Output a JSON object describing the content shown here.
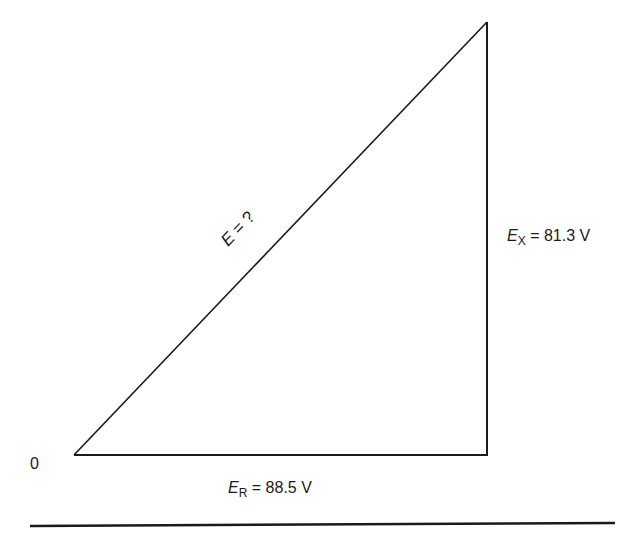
{
  "diagram": {
    "title": "",
    "origin_label": "0",
    "hypotenuse": {
      "symbol": "E",
      "label_suffix": " = ?"
    },
    "vertical_side": {
      "symbol": "E",
      "subscript": "X",
      "label_suffix": " = 81.3 V",
      "value": 81.3,
      "unit": "V"
    },
    "horizontal_side": {
      "symbol": "E",
      "subscript": "R",
      "label_suffix": " = 88.5 V",
      "value": 88.5,
      "unit": "V"
    },
    "colors": {
      "line": "#1a1a1a",
      "background": "#ffffff"
    }
  }
}
